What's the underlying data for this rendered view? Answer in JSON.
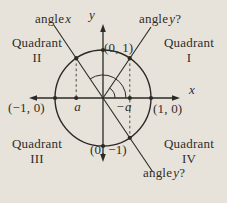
{
  "figure": {
    "bg_color": "#e7e3da",
    "ink_color": "#2b2a27",
    "angle_labels": {
      "top_left": {
        "prefix": "angle",
        "variable": "x",
        "suffix": ""
      },
      "top_right": {
        "prefix": "angle",
        "variable": "y",
        "suffix": "?"
      },
      "bottom_right": {
        "prefix": "angle",
        "variable": "y",
        "suffix": "?"
      }
    },
    "quadrants": {
      "i": {
        "word": "Quadrant",
        "numeral": "I"
      },
      "ii": {
        "word": "Quadrant",
        "numeral": "II"
      },
      "iii": {
        "word": "Quadrant",
        "numeral": "III"
      },
      "iv": {
        "word": "Quadrant",
        "numeral": "IV"
      }
    },
    "points": {
      "top": "(0, 1)",
      "right": "(1, 0)",
      "left": "(−1, 0)",
      "bottom": "(0, −1)"
    },
    "axes": {
      "x": "x",
      "y": "y"
    },
    "ticks": {
      "a": {
        "prefix": "",
        "variable": "a"
      },
      "neg_a": {
        "prefix": "−",
        "variable": "a"
      }
    }
  }
}
